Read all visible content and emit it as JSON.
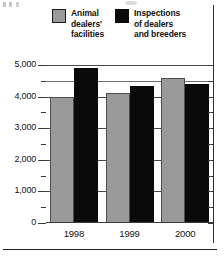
{
  "chart_data": {
    "type": "bar",
    "title": "",
    "xlabel": "",
    "ylabel": "",
    "categories": [
      "1998",
      "1999",
      "2000"
    ],
    "series": [
      {
        "name": "Animal dealers' facilities",
        "color": "#9a9a9a",
        "values": [
          4000,
          4100,
          4600
        ]
      },
      {
        "name": "Inspections of dealers and breeders",
        "color": "#0a0a0a",
        "values": [
          4900,
          4350,
          4400
        ]
      }
    ],
    "ylim": [
      0,
      5000
    ],
    "ytick_labels": [
      "0",
      "1,000",
      "2,000",
      "3,000",
      "4,000",
      "5,000"
    ],
    "ytick_values": [
      0,
      1000,
      2000,
      3000,
      4000,
      5000
    ],
    "yminor_values": [
      500,
      1500,
      2500,
      3500,
      4500
    ],
    "grid": true,
    "legend_position": "top"
  },
  "legend": {
    "entries": [
      {
        "label": "Animal\ndealers'\nfacilities",
        "swatch": "gray-swatch"
      },
      {
        "label": "Inspections\nof dealers\nand breeders",
        "swatch": "black-swatch"
      }
    ]
  }
}
